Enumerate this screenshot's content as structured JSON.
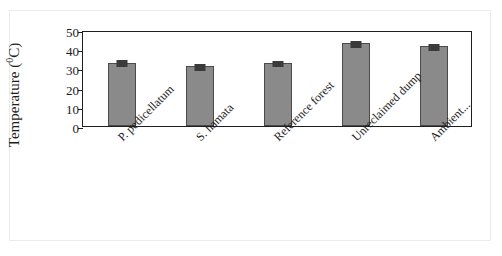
{
  "chart_data": {
    "type": "bar",
    "title": "",
    "xlabel": "",
    "ylabel": "Temperature (⁰C)",
    "ylabel_text": "Temperature (",
    "ylabel_sup": "0",
    "ylabel_tail": "C)",
    "categories": [
      "P. pedicellatum",
      "S. hamata",
      "Reference forest",
      "Unreclaimed dump",
      "Ambient..."
    ],
    "values": [
      33,
      31,
      33,
      43,
      41.5
    ],
    "errors": [
      0.8,
      0.9,
      0.6,
      0.9,
      0.7
    ],
    "ylim": [
      0,
      50
    ],
    "yticks": [
      50,
      40,
      30,
      20,
      10,
      0
    ],
    "ytick_labels": [
      "50",
      "40",
      "30",
      "20",
      "10",
      "0"
    ],
    "grid": false,
    "legend": "none",
    "series": [
      {
        "name": "Temperature",
        "values": [
          33,
          31,
          33,
          43,
          41.5
        ]
      }
    ],
    "colors": {
      "bar_fill": "#8a8a8a",
      "bar_edge": "#4a4a4a",
      "error_bar": "#3a3a3a",
      "axis": "#1f1f1f",
      "text": "#1c1c1c",
      "background": "#ffffff"
    }
  }
}
